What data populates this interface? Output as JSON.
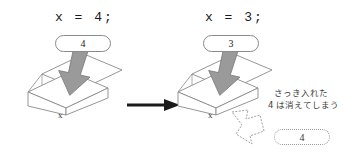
{
  "diagram": {
    "title_semantic": "variable-assignment-box-illustration",
    "panels": [
      {
        "id": "before",
        "code": "x = 4;",
        "incoming_value": "4",
        "box_label": "x"
      },
      {
        "id": "after",
        "code": "x = 3;",
        "incoming_value": "3",
        "box_label": "x"
      }
    ],
    "transition_arrow": "right-arrow",
    "annotation": {
      "line1": "さっき入れた",
      "line2": "4 は消えてしまう",
      "discarded_value": "4"
    },
    "colors": {
      "ink": "#1a1a1a",
      "outline": "#8a8a8a",
      "fill_arrow": "#9a9a9a",
      "arrow_stroke": "#7a7a7a",
      "background": "#ffffff",
      "note_text": "#3c3c3c"
    }
  }
}
